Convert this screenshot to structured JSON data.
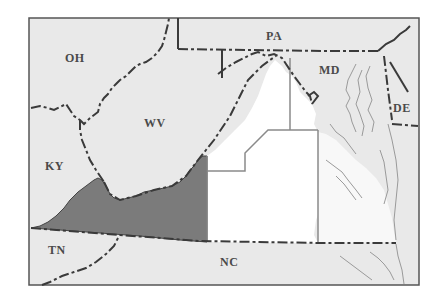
{
  "map": {
    "title": "",
    "colors": {
      "background": "#ffffff",
      "land": "#e8e8e8",
      "highlight_region": "#7a7a7a",
      "study_area": "#ffffff",
      "state_border": "#3a3a3a",
      "region_outline": "#8a8a8a",
      "coastline": "#9a9a9a",
      "frame": "#555555"
    },
    "state_labels": [
      {
        "id": "oh",
        "text": "OH"
      },
      {
        "id": "pa",
        "text": "PA"
      },
      {
        "id": "md",
        "text": "MD"
      },
      {
        "id": "wv",
        "text": "WV"
      },
      {
        "id": "de",
        "text": "DE"
      },
      {
        "id": "ky",
        "text": "KY"
      },
      {
        "id": "tn",
        "text": "TN"
      },
      {
        "id": "nc",
        "text": "NC"
      }
    ],
    "regions": [
      {
        "id": "southwest-virginia",
        "fill": "shaded-dark"
      },
      {
        "id": "central-virginia",
        "fill": "white"
      },
      {
        "id": "northern-virginia",
        "fill": "white"
      },
      {
        "id": "tidewater-virginia",
        "fill": "light"
      }
    ]
  }
}
